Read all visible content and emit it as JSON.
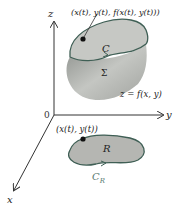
{
  "diagram": {
    "axes": {
      "z": "z",
      "y": "y",
      "x": "x",
      "origin": "0"
    },
    "surface": {
      "point_label": "(x(t), y(t), f(x(t), y(t)))",
      "curve_label": "C",
      "surface_label": "Σ",
      "equation": "z = f(x, y)"
    },
    "region": {
      "point_label": "(x(t), y(t))",
      "region_label": "R",
      "curve_label": "C",
      "curve_subscript": "R"
    },
    "colors": {
      "surface_fill": "#b8bab6",
      "surface_top": "#c9cbc7",
      "boundary": "#3f5f55",
      "region_fill": "#b5b6b2",
      "curve_label": "#5a7a70",
      "axis": "#333333"
    }
  }
}
